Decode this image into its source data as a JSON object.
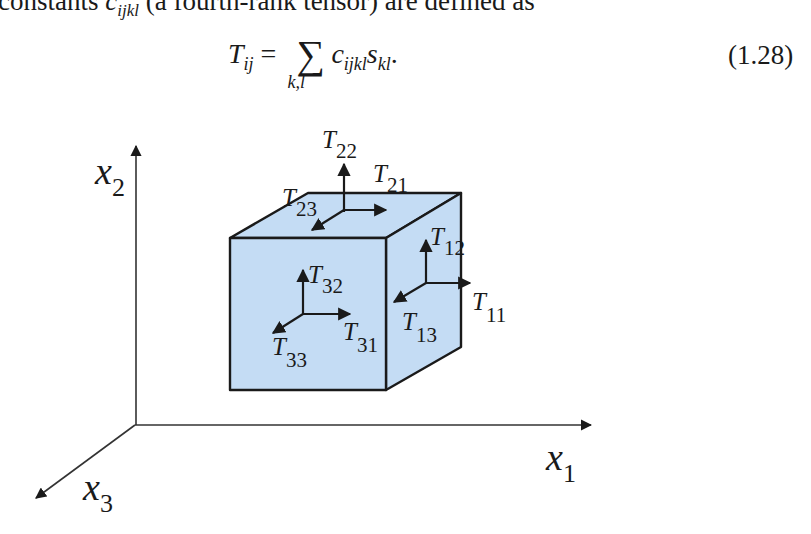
{
  "text": {
    "intro_prefix": "constants ",
    "intro_symbol": "c",
    "intro_symbol_sub": "ijkl",
    "intro_suffix": " (a fourth-rank tensor) are defined as"
  },
  "equation": {
    "lhs": "T",
    "lhs_sub": "ij",
    "equals": "=",
    "sum_symbol": "∑",
    "sum_under": "k,l",
    "term1": "c",
    "term1_sub": "ijkl",
    "term2": "s",
    "term2_sub": "kl",
    "period": ".",
    "number": "(1.28)"
  },
  "figure": {
    "fill_color": "#c4dcf4",
    "stroke_color": "#1a1a1a",
    "axes": [
      {
        "name": "x1",
        "main": "x",
        "sub": "1"
      },
      {
        "name": "x2",
        "main": "x",
        "sub": "2"
      },
      {
        "name": "x3",
        "main": "x",
        "sub": "3"
      }
    ],
    "stress_labels": {
      "T22": {
        "main": "T",
        "sub": "22"
      },
      "T21": {
        "main": "T",
        "sub": "21"
      },
      "T23": {
        "main": "T",
        "sub": "23"
      },
      "T12": {
        "main": "T",
        "sub": "12"
      },
      "T11": {
        "main": "T",
        "sub": "11"
      },
      "T13": {
        "main": "T",
        "sub": "13"
      },
      "T32": {
        "main": "T",
        "sub": "32"
      },
      "T31": {
        "main": "T",
        "sub": "31"
      },
      "T33": {
        "main": "T",
        "sub": "33"
      }
    }
  }
}
